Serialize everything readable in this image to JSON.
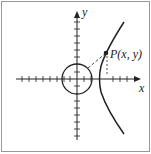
{
  "diagram": {
    "axis_labels": {
      "x": "x",
      "y": "y"
    },
    "point_label": "P(x, y)",
    "colors": {
      "stroke": "#222222",
      "border": "#999999",
      "background": "#ffffff"
    },
    "elements": [
      "x-axis",
      "y-axis",
      "circle-centered-at-origin",
      "hyperbola-right-branch",
      "point-P",
      "dashed-tangent-line",
      "dashed-vertical-drop"
    ]
  }
}
